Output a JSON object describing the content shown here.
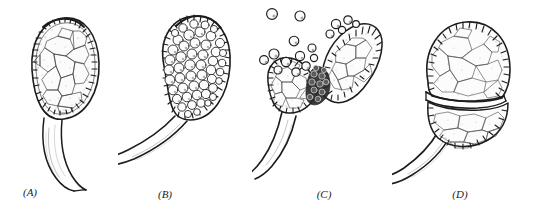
{
  "figure": {
    "background_color": "#ffffff",
    "ink_color": "#1c1c1c",
    "panel_count": 4
  },
  "panels": [
    {
      "id": "a",
      "label": "(A)",
      "stage_name": "intact-sporangium-vegetative",
      "description": "Closed pear-shaped sporangium on a curved tapering stalk; wall of beaded marginal cells; interior a mosaic of large polygonal cells",
      "wall_cells": 30,
      "interior_pattern": "polygonal",
      "free_spores": 0,
      "stalk_direction": "down-right",
      "split": "none"
    },
    {
      "id": "b",
      "label": "(B)",
      "stage_name": "sporangium-filled-with-spores",
      "description": "Closed sporangium packed with rounded spores; stalk sweeps to the lower left and leaves the frame",
      "wall_cells": 32,
      "interior_pattern": "spherical-spores",
      "interior_spore_count": 62,
      "free_spores": 0,
      "stalk_direction": "down-left",
      "split": "none"
    },
    {
      "id": "c",
      "label": "(C)",
      "stage_name": "dehiscence-spores-ejected",
      "description": "Sporangium split into two gaping valves; dark spore mass in the cleft; spores puffing away above and to the upper left",
      "wall_cells": 34,
      "interior_pattern": "polygonal",
      "free_spores": 17,
      "stalk_direction": "down-left",
      "split": "two-valves-oblique"
    },
    {
      "id": "d",
      "label": "(D)",
      "stage_name": "emptied-sporangium-transverse-split",
      "description": "Emptied sporangium opened along a transverse dehiscence line into upper and lower halves; stalk doubled below",
      "wall_cells": 31,
      "interior_pattern": "polygonal",
      "free_spores": 0,
      "stalk_direction": "down-left",
      "split": "transverse-line"
    }
  ]
}
